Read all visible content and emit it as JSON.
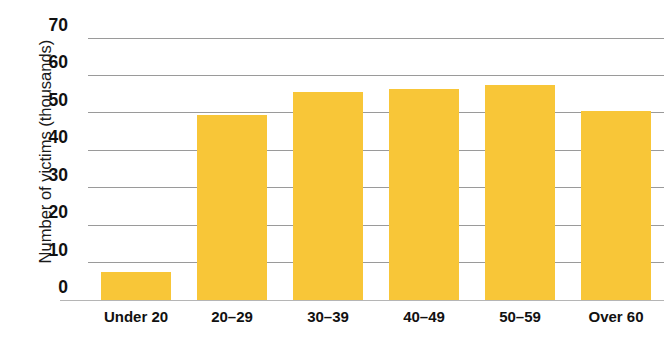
{
  "chart_data": {
    "type": "bar",
    "title": "",
    "xlabel": "",
    "ylabel": "Number of victims (thousands)",
    "categories": [
      "Under 20",
      "20–29",
      "30–39",
      "40–49",
      "50–59",
      "Over 60"
    ],
    "values": [
      7.5,
      49.5,
      55.5,
      56.5,
      57.5,
      50.5
    ],
    "ylim": [
      0,
      70
    ],
    "yticks": [
      0,
      10,
      20,
      30,
      40,
      50,
      60,
      70
    ],
    "ytick_labels": [
      "0",
      "10",
      "20",
      "30",
      "40",
      "50",
      "60",
      "70"
    ],
    "grid": true,
    "legend": false,
    "bar_color": "#f8c638",
    "gridline_color": "#9a9a9a",
    "axis_color": "#b5b5b5",
    "background": "#ffffff"
  },
  "axes": {
    "y_title": "Number of victims (thousands)"
  }
}
